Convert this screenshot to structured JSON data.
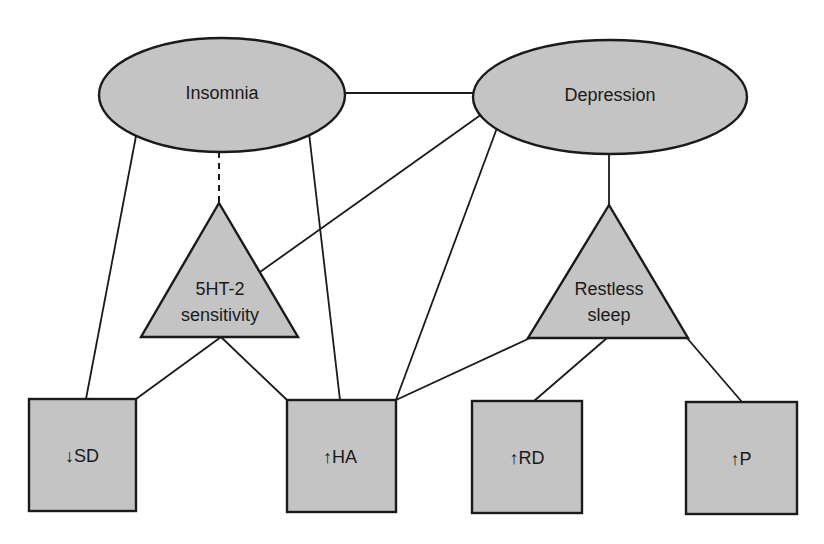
{
  "diagram": {
    "type": "relationship-graph",
    "colors": {
      "node_fill": "#c4c4c4",
      "stroke": "#1a1a1a",
      "background": "#ffffff",
      "text": "#1a1a1a"
    },
    "nodes": {
      "insomnia": {
        "label": "Insomnia",
        "shape": "ellipse"
      },
      "depression": {
        "label": "Depression",
        "shape": "ellipse"
      },
      "serotonin": {
        "label_line1": "5HT-2",
        "label_line2": "sensitivity",
        "shape": "triangle"
      },
      "restless": {
        "label_line1": "Restless",
        "label_line2": "sleep",
        "shape": "triangle"
      },
      "sd": {
        "label": "↓SD",
        "shape": "square"
      },
      "ha": {
        "label": "↑HA",
        "shape": "square"
      },
      "rd": {
        "label": "↑RD",
        "shape": "square"
      },
      "p": {
        "label": "↑P",
        "shape": "square"
      }
    },
    "edges": [
      {
        "from": "Insomnia",
        "to": "Depression",
        "style": "solid"
      },
      {
        "from": "Insomnia",
        "to": "5HT-2 sensitivity",
        "style": "dashed"
      },
      {
        "from": "Insomnia",
        "to": "↓SD",
        "style": "solid"
      },
      {
        "from": "Insomnia",
        "to": "↑HA",
        "style": "solid"
      },
      {
        "from": "Depression",
        "to": "5HT-2 sensitivity",
        "style": "solid"
      },
      {
        "from": "Depression",
        "to": "↑HA",
        "style": "solid"
      },
      {
        "from": "Depression",
        "to": "Restless sleep",
        "style": "solid"
      },
      {
        "from": "5HT-2 sensitivity",
        "to": "↓SD",
        "style": "solid"
      },
      {
        "from": "5HT-2 sensitivity",
        "to": "↑HA",
        "style": "solid"
      },
      {
        "from": "Restless sleep",
        "to": "↑HA",
        "style": "solid"
      },
      {
        "from": "Restless sleep",
        "to": "↑RD",
        "style": "solid"
      },
      {
        "from": "Restless sleep",
        "to": "↑P",
        "style": "solid"
      }
    ]
  }
}
